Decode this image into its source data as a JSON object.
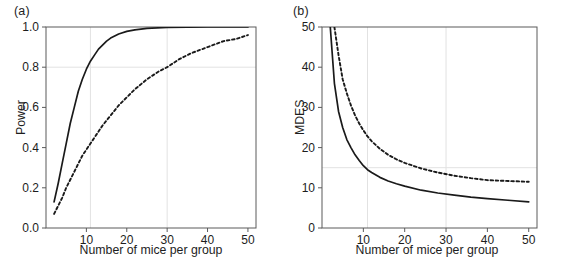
{
  "figure": {
    "background": "#ffffff",
    "axis_color": "#5a5a5a",
    "grid_color": "#e2e2e2",
    "curve_color": "#1a1a1a",
    "text_color": "#1d1d1d"
  },
  "panels": [
    {
      "label": "(a)",
      "name": "panel-a"
    },
    {
      "label": "(b)",
      "name": "panel-b"
    }
  ],
  "chart_data": [
    {
      "type": "line",
      "panel": "(a)",
      "title": "",
      "xlabel": "Number of mice per group",
      "ylabel": "Power",
      "xlim": [
        0,
        52
      ],
      "ylim": [
        0.0,
        1.0
      ],
      "xticks": [
        10,
        20,
        30,
        40,
        50
      ],
      "xticklabels": [
        "10",
        "20",
        "30",
        "40",
        "50"
      ],
      "yticks": [
        0.0,
        0.2,
        0.4,
        0.6,
        0.8,
        1.0
      ],
      "yticklabels": [
        "0.0",
        "0.2",
        "0.4",
        "0.6",
        "0.8",
        "1.0"
      ],
      "grid": true,
      "gridlines_x": [
        11,
        30
      ],
      "gridlines_y": [
        0.8
      ],
      "legend": "none",
      "series": [
        {
          "name": "solid",
          "style": "solid",
          "x": [
            2,
            3,
            4,
            5,
            6,
            7,
            8,
            9,
            10,
            11,
            12,
            13,
            14,
            15,
            16,
            17,
            18,
            20,
            22,
            25,
            30,
            35,
            40,
            45,
            50
          ],
          "values": [
            0.13,
            0.22,
            0.32,
            0.42,
            0.52,
            0.6,
            0.68,
            0.74,
            0.79,
            0.83,
            0.86,
            0.89,
            0.91,
            0.93,
            0.945,
            0.955,
            0.965,
            0.978,
            0.986,
            0.993,
            0.998,
            0.999,
            1.0,
            1.0,
            1.0
          ]
        },
        {
          "name": "dashed",
          "style": "dashed",
          "x": [
            2,
            3,
            4,
            5,
            6,
            7,
            8,
            9,
            10,
            11,
            12,
            14,
            16,
            18,
            20,
            22,
            25,
            28,
            30,
            33,
            36,
            40,
            44,
            47,
            50
          ],
          "values": [
            0.07,
            0.11,
            0.15,
            0.2,
            0.24,
            0.28,
            0.32,
            0.36,
            0.39,
            0.42,
            0.45,
            0.51,
            0.56,
            0.61,
            0.65,
            0.69,
            0.74,
            0.78,
            0.8,
            0.84,
            0.87,
            0.9,
            0.93,
            0.94,
            0.96
          ]
        }
      ]
    },
    {
      "type": "line",
      "panel": "(b)",
      "title": "",
      "xlabel": "Number of mice per group",
      "ylabel": "MDES",
      "xlim": [
        0,
        52
      ],
      "ylim": [
        0,
        50
      ],
      "xticks": [
        10,
        20,
        30,
        40,
        50
      ],
      "xticklabels": [
        "10",
        "20",
        "30",
        "40",
        "50"
      ],
      "yticks": [
        0,
        10,
        20,
        30,
        40,
        50
      ],
      "yticklabels": [
        "0",
        "10",
        "20",
        "30",
        "40",
        "50"
      ],
      "grid": true,
      "gridlines_x": [
        11,
        30
      ],
      "gridlines_y": [
        15
      ],
      "legend": "none",
      "series": [
        {
          "name": "solid",
          "style": "solid",
          "x": [
            2,
            3,
            4,
            5,
            6,
            7,
            8,
            9,
            10,
            11,
            12,
            14,
            16,
            18,
            20,
            24,
            28,
            32,
            36,
            40,
            45,
            50
          ],
          "values": [
            50,
            36,
            29,
            25,
            22,
            20,
            18.2,
            16.8,
            15.5,
            14.5,
            13.8,
            12.6,
            11.7,
            11.0,
            10.4,
            9.4,
            8.7,
            8.2,
            7.7,
            7.3,
            6.9,
            6.5
          ]
        },
        {
          "name": "dashed",
          "style": "dashed",
          "x": [
            3,
            4,
            5,
            6,
            7,
            8,
            9,
            10,
            11,
            12,
            14,
            16,
            18,
            20,
            24,
            28,
            32,
            36,
            40,
            45,
            50
          ],
          "values": [
            50,
            43,
            37,
            33.5,
            30.5,
            28,
            26,
            24.3,
            22.8,
            21.6,
            19.7,
            18.2,
            17.1,
            16.2,
            14.8,
            13.8,
            13.0,
            12.4,
            11.9,
            11.7,
            11.5
          ]
        }
      ]
    }
  ]
}
